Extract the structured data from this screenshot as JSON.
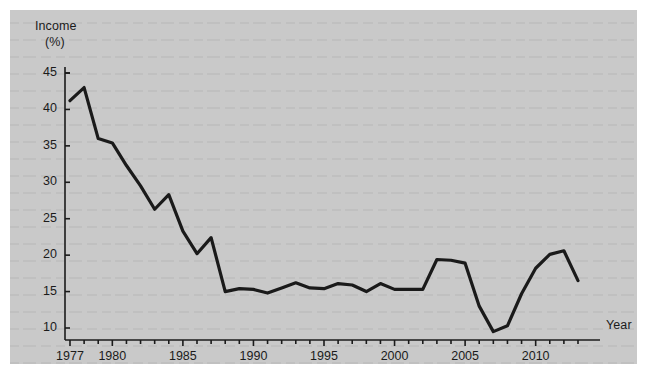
{
  "figure": {
    "background_color": "#c9c9c9",
    "page_color": "#ffffff"
  },
  "axes": {
    "y_title_line1": "Income",
    "y_title_line2": "(%)",
    "x_title": "Year"
  },
  "chart_data": {
    "type": "line",
    "title": "",
    "subtitle": "",
    "xlabel": "Year",
    "ylabel": "Income (%)",
    "xlim": [
      1977,
      2013
    ],
    "ylim": [
      7.5,
      46
    ],
    "grid": false,
    "legend_position": "none",
    "line_color": "#1a1a1a",
    "line_width": 3.2,
    "y_ticks": [
      10,
      15,
      20,
      25,
      30,
      35,
      40,
      45
    ],
    "y_tick_labels": [
      "10",
      "15",
      "20",
      "25",
      "30",
      "35",
      "40",
      "45"
    ],
    "x_ticks": [
      1977,
      1978,
      1979,
      1980,
      1981,
      1982,
      1983,
      1984,
      1985,
      1986,
      1987,
      1988,
      1989,
      1990,
      1991,
      1992,
      1993,
      1994,
      1995,
      1996,
      1997,
      1998,
      1999,
      2000,
      2001,
      2002,
      2003,
      2004,
      2005,
      2006,
      2007,
      2008,
      2009,
      2010,
      2011,
      2012,
      2013
    ],
    "x_tick_labels_shown": [
      "1977",
      "1980",
      "1985",
      "1990",
      "1995",
      "2000",
      "2005",
      "2010"
    ],
    "x_labeled_ticks": [
      1977,
      1980,
      1985,
      1990,
      1995,
      2000,
      2005,
      2010
    ],
    "x": [
      1977,
      1978,
      1979,
      1980,
      1981,
      1982,
      1983,
      1984,
      1985,
      1986,
      1987,
      1988,
      1989,
      1990,
      1991,
      1992,
      1993,
      1994,
      1995,
      1996,
      1997,
      1998,
      1999,
      2000,
      2001,
      2002,
      2003,
      2004,
      2005,
      2006,
      2007,
      2008,
      2009,
      2010,
      2011,
      2012,
      2013
    ],
    "values": [
      41.2,
      43.0,
      36.0,
      35.4,
      32.3,
      29.5,
      26.3,
      28.3,
      23.3,
      20.2,
      22.4,
      15.0,
      15.4,
      15.3,
      14.8,
      15.5,
      16.2,
      15.5,
      15.4,
      16.1,
      15.9,
      15.0,
      16.1,
      15.3,
      15.3,
      15.3,
      19.4,
      19.3,
      18.9,
      13.0,
      9.5,
      10.3,
      14.7,
      18.2,
      20.1,
      20.6,
      16.5
    ]
  }
}
